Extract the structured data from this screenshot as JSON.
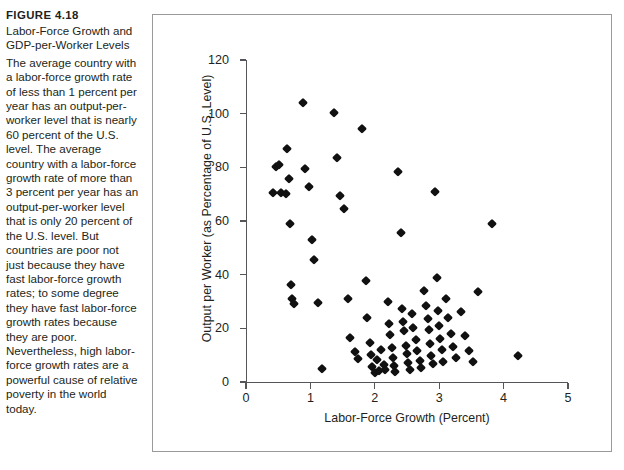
{
  "caption": {
    "figure_number": "FIGURE 4.18",
    "title": "Labor-Force Growth and GDP-per-Worker Levels",
    "body": "The average country with a labor-force growth rate of less than 1 percent per year has an output-per-worker level that is nearly 60 percent of the U.S. level. The average country with a labor-force growth rate of more than 3 percent per year has an output-per-worker level that is only 20 percent of the U.S. level. But countries are poor not just because they have fast labor-force growth rates; to some degree they have fast labor-force growth rates because they are poor. Nevertheless, high labor-force growth rates are a powerful cause of relative poverty in the world today."
  },
  "chart_data": {
    "type": "scatter",
    "title": "",
    "xlabel": "Labor-Force Growth (Percent)",
    "ylabel": "Output per Worker (as Percentage of U.S. Level)",
    "xlim": [
      0,
      5
    ],
    "ylim": [
      0,
      120
    ],
    "xticks": [
      0,
      1,
      2,
      3,
      4,
      5
    ],
    "yticks": [
      0,
      20,
      40,
      60,
      80,
      100,
      120
    ],
    "xtick_labels": [
      "0",
      "1",
      "2",
      "3",
      "4",
      "5"
    ],
    "ytick_labels": [
      "0",
      "20",
      "40",
      "60",
      "80",
      "100",
      "120"
    ],
    "grid": false,
    "legend": false,
    "marker": "diamond",
    "marker_color": "#111111",
    "points": [
      [
        0.42,
        70.5
      ],
      [
        0.46,
        80.3
      ],
      [
        0.52,
        81.0
      ],
      [
        0.55,
        70.3
      ],
      [
        0.62,
        70.2
      ],
      [
        0.63,
        86.8
      ],
      [
        0.66,
        75.5
      ],
      [
        0.68,
        58.7
      ],
      [
        0.7,
        36.2
      ],
      [
        0.72,
        30.8
      ],
      [
        0.74,
        29.0
      ],
      [
        0.88,
        103.8
      ],
      [
        0.92,
        79.2
      ],
      [
        0.98,
        72.8
      ],
      [
        1.02,
        52.8
      ],
      [
        1.06,
        45.6
      ],
      [
        1.12,
        29.4
      ],
      [
        1.18,
        5.0
      ],
      [
        1.36,
        100.3
      ],
      [
        1.42,
        83.5
      ],
      [
        1.46,
        69.3
      ],
      [
        1.52,
        64.4
      ],
      [
        1.58,
        30.8
      ],
      [
        1.62,
        16.5
      ],
      [
        1.7,
        11.2
      ],
      [
        1.74,
        8.4
      ],
      [
        1.8,
        94.2
      ],
      [
        1.86,
        37.8
      ],
      [
        1.88,
        24.0
      ],
      [
        1.92,
        14.6
      ],
      [
        1.94,
        10.2
      ],
      [
        1.96,
        5.6
      ],
      [
        2.0,
        3.4
      ],
      [
        2.04,
        8.2
      ],
      [
        2.06,
        4.0
      ],
      [
        2.1,
        12.1
      ],
      [
        2.14,
        6.3
      ],
      [
        2.16,
        4.6
      ],
      [
        2.2,
        30.0
      ],
      [
        2.22,
        21.5
      ],
      [
        2.24,
        17.4
      ],
      [
        2.26,
        12.6
      ],
      [
        2.28,
        9.1
      ],
      [
        2.3,
        6.0
      ],
      [
        2.32,
        3.6
      ],
      [
        2.36,
        78.2
      ],
      [
        2.4,
        55.4
      ],
      [
        2.42,
        27.3
      ],
      [
        2.44,
        22.4
      ],
      [
        2.46,
        18.9
      ],
      [
        2.48,
        13.5
      ],
      [
        2.5,
        10.4
      ],
      [
        2.52,
        7.2
      ],
      [
        2.54,
        4.4
      ],
      [
        2.58,
        25.2
      ],
      [
        2.6,
        20.1
      ],
      [
        2.64,
        15.8
      ],
      [
        2.66,
        11.4
      ],
      [
        2.7,
        8.0
      ],
      [
        2.72,
        5.1
      ],
      [
        2.76,
        33.9
      ],
      [
        2.8,
        28.4
      ],
      [
        2.82,
        23.5
      ],
      [
        2.84,
        19.2
      ],
      [
        2.86,
        14.0
      ],
      [
        2.88,
        9.6
      ],
      [
        2.9,
        6.8
      ],
      [
        2.94,
        70.8
      ],
      [
        2.96,
        38.6
      ],
      [
        2.98,
        26.3
      ],
      [
        3.0,
        21.0
      ],
      [
        3.02,
        16.2
      ],
      [
        3.04,
        12.0
      ],
      [
        3.06,
        7.6
      ],
      [
        3.1,
        31.0
      ],
      [
        3.14,
        23.8
      ],
      [
        3.18,
        18.0
      ],
      [
        3.22,
        13.2
      ],
      [
        3.26,
        9.0
      ],
      [
        3.34,
        26.0
      ],
      [
        3.4,
        17.2
      ],
      [
        3.46,
        11.6
      ],
      [
        3.52,
        7.4
      ],
      [
        3.6,
        33.6
      ],
      [
        3.82,
        59.0
      ],
      [
        4.22,
        9.6
      ]
    ]
  }
}
